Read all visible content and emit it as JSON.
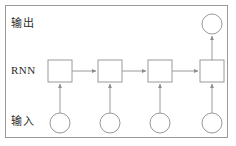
{
  "figure": {
    "title_visible": false,
    "background_color": "#ffffff",
    "border_color": "#9a9a9a",
    "stroke_color": "#9a9a9a",
    "node_fill": "#ffffff",
    "text_color": "#2b2b2b"
  },
  "labels": {
    "output": "输出",
    "rnn": "RNN",
    "input": "输入"
  },
  "diagram": {
    "type": "rnn-unrolled",
    "timesteps": 4,
    "rnn_cells": [
      {
        "name": "rnn-cell-1",
        "cx": 60,
        "cy": 71,
        "w": 24,
        "h": 22
      },
      {
        "name": "rnn-cell-2",
        "cx": 110,
        "cy": 71,
        "w": 24,
        "h": 22
      },
      {
        "name": "rnn-cell-3",
        "cx": 160,
        "cy": 71,
        "w": 24,
        "h": 22
      },
      {
        "name": "rnn-cell-4",
        "cx": 212,
        "cy": 71,
        "w": 24,
        "h": 22
      }
    ],
    "input_nodes": [
      {
        "name": "input-node-1",
        "cx": 60,
        "cy": 123,
        "r": 10
      },
      {
        "name": "input-node-2",
        "cx": 110,
        "cy": 123,
        "r": 10
      },
      {
        "name": "input-node-3",
        "cx": 160,
        "cy": 123,
        "r": 10
      },
      {
        "name": "input-node-4",
        "cx": 212,
        "cy": 123,
        "r": 10
      }
    ],
    "output_nodes": [
      {
        "name": "output-node-1",
        "cx": 212,
        "cy": 24,
        "r": 10
      }
    ],
    "edges": [
      {
        "name": "edge-rnn-1-to-2",
        "kind": "horizontal-recurrent"
      },
      {
        "name": "edge-rnn-2-to-3",
        "kind": "horizontal-recurrent"
      },
      {
        "name": "edge-rnn-3-to-4",
        "kind": "horizontal-recurrent"
      },
      {
        "name": "edge-input-1-to-rnn-1",
        "kind": "vertical-input"
      },
      {
        "name": "edge-input-2-to-rnn-2",
        "kind": "vertical-input"
      },
      {
        "name": "edge-input-3-to-rnn-3",
        "kind": "vertical-input"
      },
      {
        "name": "edge-input-4-to-rnn-4",
        "kind": "vertical-input"
      },
      {
        "name": "edge-rnn-4-to-output-1",
        "kind": "vertical-output"
      }
    ]
  }
}
